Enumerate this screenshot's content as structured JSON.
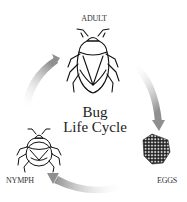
{
  "diagram": {
    "title_line1": "Bug",
    "title_line2": "Life Cycle",
    "stages": [
      {
        "label": "ADULT",
        "icon": "adult-bug-icon"
      },
      {
        "label": "EGGS",
        "icon": "egg-cluster-icon"
      },
      {
        "label": "NYMPH",
        "icon": "nymph-bug-icon"
      }
    ],
    "arrow_color": "#9a9a9a",
    "arrows": [
      "adult-to-eggs",
      "eggs-to-nymph",
      "nymph-to-adult"
    ]
  }
}
